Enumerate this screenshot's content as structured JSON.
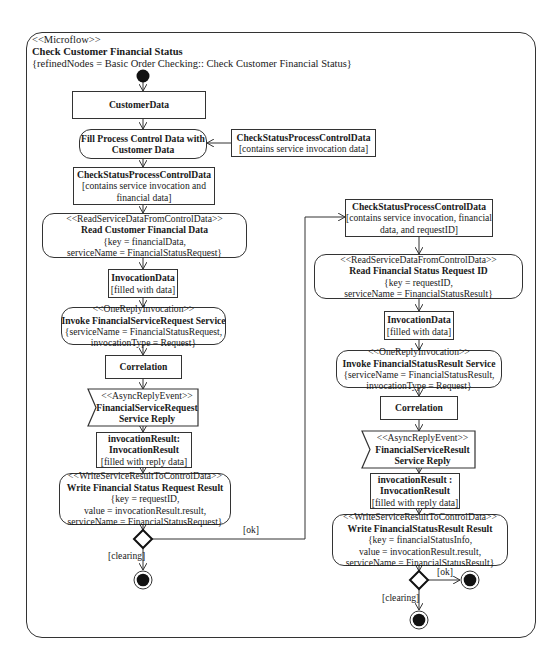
{
  "frame": {
    "stereotype": "<<Microflow>>",
    "title": "Check Customer Financial Status",
    "constraint": "{refinedNodes = Basic Order Checking:: Check Customer Financial Status}"
  },
  "left_column": {
    "customer_data": {
      "title": "CustomerData"
    },
    "fill_action": {
      "line1": "Fill Process Control Data with",
      "line2": "Customer Data"
    },
    "side_object": {
      "title": "CheckStatusProcessControlData",
      "state": "[contains service invocation data]"
    },
    "control_data": {
      "title": "CheckStatusProcessControlData",
      "state1": "[contains service invocation and",
      "state2": "financial data]"
    },
    "read_action": {
      "stereotype": "<<ReadServiceDataFromControlData>>",
      "title": "Read Customer Financial Data",
      "param1": "{key = financialData,",
      "param2": "serviceName = FinancialStatusRequest}"
    },
    "invocation_data": {
      "title": "InvocationData",
      "state": "[filled with data]"
    },
    "invoke_action": {
      "stereotype": "<<OneReplyInvocation>>",
      "title": "Invoke FinancialServiceRequest Service",
      "param1": "{serviceName = FinancialStatusRequest,",
      "param2": "invocationType = Request}"
    },
    "correlation": {
      "title": "Correlation"
    },
    "reply_event": {
      "stereotype": "<<AsyncReplyEvent>>",
      "title1": "FinancialServiceRequest",
      "title2": "Service Reply"
    },
    "invocation_result": {
      "title1": "invocationResult:",
      "title2": "InvocationResult",
      "state": "[filled with reply data]"
    },
    "write_action": {
      "stereotype": "<<WriteServiceResultToControlData>>",
      "title": "Write Financial Status Request Result",
      "param1": "{key = requestID,",
      "param2": "value = invocationResult.result,",
      "param3": "serviceName = FinancialStatusRequest}"
    },
    "guard_ok": "[ok]",
    "guard_clearing": "[clearing]"
  },
  "right_column": {
    "control_data": {
      "title": "CheckStatusProcessControlData",
      "state1": "[contains service invocation, financial",
      "state2": "data, and requestID]"
    },
    "read_action": {
      "stereotype": "<<ReadServiceDataFromControlData>>",
      "title": "Read Financial Status Request ID",
      "param1": "{key = requestID,",
      "param2": "serviceName = FinancialStatusResult}"
    },
    "invocation_data": {
      "title": "InvocationData",
      "state": "[filled with data]"
    },
    "invoke_action": {
      "stereotype": "<<OneReplyInvocation>>",
      "title": "Invoke FinancialStatusResult Service",
      "param1": "{serviceName = FinancialStatusResult,",
      "param2": "invocationType = Request}"
    },
    "correlation": {
      "title": "Correlation"
    },
    "reply_event": {
      "stereotype": "<<AsyncReplyEvent>>",
      "title1": "FinancialServiceResult",
      "title2": "Service Reply"
    },
    "invocation_result": {
      "title1": "invocationResult :",
      "title2": "InvocationResult",
      "state": "[filled with reply data]"
    },
    "write_action": {
      "stereotype": "<<WriteServiceResultToControlData>>",
      "title": "Write FinancialStatusResult Result",
      "param1": "{key = financialStatusInfo,",
      "param2": "value = invocationResult.result,",
      "param3": "serviceName = FinancialStatusResult}"
    },
    "guard_ok": "[ok]",
    "guard_clearing": "[clearing]"
  },
  "colors": {
    "stroke": "#333333",
    "fill_node": "#111111",
    "background": "#ffffff"
  }
}
